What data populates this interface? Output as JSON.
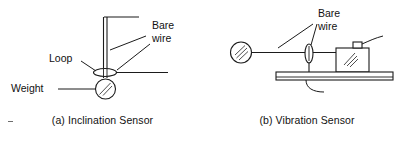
{
  "figure": {
    "background_color": "#ffffff",
    "line_color": "#1b1b1b",
    "hatch_color": "#3a3a3a"
  },
  "panel_a": {
    "caption": "(a) Inclination Sensor",
    "labels": {
      "bare_wire_line1": "Bare",
      "bare_wire_line2": "wire",
      "loop": "Loop",
      "weight": "Weight"
    },
    "components": [
      "vertical-bare-wire",
      "top-horizontal-bar",
      "loop-ellipse",
      "horizontal-contact-wire",
      "weight-disc"
    ]
  },
  "panel_b": {
    "caption": "(b) Vibration Sensor",
    "labels": {
      "bare_wire_line1": "Bare",
      "bare_wire_line2": "wire"
    },
    "components": [
      "anchor-disc",
      "horizontal-bare-wire",
      "loop-ellipse",
      "mounting-plate",
      "mass-block",
      "block-terminal-tab"
    ]
  }
}
